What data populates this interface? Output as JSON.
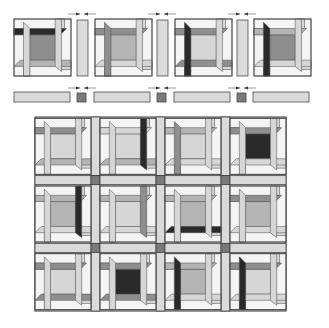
{
  "figure": {
    "colors": {
      "white": "#f4f4f4",
      "light": "#d6d6d6",
      "medium": "#b4b4b4",
      "mediumDark": "#8e8e8e",
      "dark": "#2a2a2a",
      "outline": "#4a4a4a",
      "cornerstone": "#7a7a7a",
      "sash": "#dadada"
    },
    "top_row": {
      "blocks": [
        {
          "x": 14,
          "y": 19,
          "size": 57,
          "top": "dark",
          "bottom": "medium",
          "left": "light",
          "right": "light",
          "center": "mediumDark",
          "cornerTL": "white"
        },
        {
          "x": 95,
          "y": 19,
          "size": 57,
          "top": "mediumDark",
          "bottom": "light",
          "left": "mediumDark",
          "right": "light",
          "center": "medium",
          "cornerTL": "white"
        },
        {
          "x": 175,
          "y": 19,
          "size": 57,
          "top": "mediumDark",
          "bottom": "mediumDark",
          "left": "dark",
          "right": "light",
          "center": "light",
          "cornerTL": "white"
        },
        {
          "x": 254,
          "y": 19,
          "size": 57,
          "top": "medium",
          "bottom": "light",
          "left": "dark",
          "right": "light",
          "center": "mediumDark",
          "cornerTL": "white"
        }
      ],
      "vertical_sashes": [
        {
          "x": 77,
          "y": 20,
          "w": 11,
          "h": 56
        },
        {
          "x": 157,
          "y": 20,
          "w": 11,
          "h": 56
        },
        {
          "x": 237,
          "y": 20,
          "w": 11,
          "h": 56
        }
      ],
      "press_arrows": [
        {
          "cx": 82,
          "y": 14
        },
        {
          "cx": 162,
          "y": 14
        },
        {
          "cx": 242,
          "y": 14
        }
      ]
    },
    "sash_row": {
      "strips": [
        {
          "x": 14,
          "y": 92,
          "w": 56,
          "h": 10
        },
        {
          "x": 94,
          "y": 92,
          "w": 56,
          "h": 10
        },
        {
          "x": 174,
          "y": 92,
          "w": 56,
          "h": 10
        },
        {
          "x": 253,
          "y": 92,
          "w": 56,
          "h": 10
        }
      ],
      "cornerstones": [
        {
          "x": 77,
          "y": 93,
          "s": 9
        },
        {
          "x": 157,
          "y": 93,
          "s": 9
        },
        {
          "x": 237,
          "y": 93,
          "s": 9
        }
      ],
      "press_arrows": [
        {
          "cx": 82,
          "y": 88
        },
        {
          "cx": 162,
          "y": 88
        },
        {
          "cx": 242,
          "y": 88
        }
      ]
    },
    "assembled_quilt": {
      "x": 35,
      "y": 117,
      "w": 251,
      "h": 194,
      "rows": 3,
      "cols": 4,
      "block_size": 54,
      "sash_width": 9,
      "blocks": [
        {
          "top": "mediumDark",
          "bottom": "medium",
          "left": "light",
          "right": "light",
          "center": "light",
          "accent": "none"
        },
        {
          "top": "light",
          "bottom": "medium",
          "left": "light",
          "right": "dark",
          "center": "light",
          "accent": "none"
        },
        {
          "top": "medium",
          "bottom": "light",
          "left": "mediumDark",
          "right": "light",
          "center": "light",
          "accent": "none"
        },
        {
          "top": "mediumDark",
          "bottom": "light",
          "left": "light",
          "right": "light",
          "center": "dark",
          "accent": "none"
        },
        {
          "top": "medium",
          "bottom": "light",
          "left": "light",
          "right": "dark",
          "center": "medium",
          "accent": "none"
        },
        {
          "top": "medium",
          "bottom": "light",
          "left": "light",
          "right": "mediumDark",
          "center": "light",
          "accent": "none"
        },
        {
          "top": "medium",
          "bottom": "dark",
          "left": "light",
          "right": "light",
          "center": "medium",
          "accent": "none"
        },
        {
          "top": "mediumDark",
          "bottom": "light",
          "left": "light",
          "right": "light",
          "center": "medium",
          "accent": "none"
        },
        {
          "top": "mediumDark",
          "bottom": "mediumDark",
          "left": "light",
          "right": "light",
          "center": "light",
          "accent": "none"
        },
        {
          "top": "mediumDark",
          "bottom": "mediumDark",
          "left": "light",
          "right": "light",
          "center": "dark",
          "accent": "none"
        },
        {
          "top": "medium",
          "bottom": "light",
          "left": "dark",
          "right": "light",
          "center": "medium",
          "accent": "none"
        },
        {
          "top": "mediumDark",
          "bottom": "light",
          "left": "dark",
          "right": "light",
          "center": "light",
          "accent": "none"
        }
      ]
    }
  }
}
